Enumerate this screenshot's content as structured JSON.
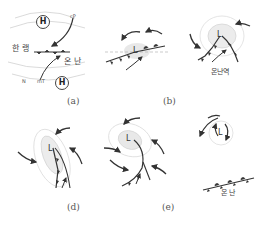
{
  "figure": {
    "colors": {
      "line": "#333333",
      "isobar": "#cfcfcf",
      "shade": "#e6e6e6"
    },
    "panels": [
      {
        "id": "a",
        "label": "(a)",
        "texts": {
          "cold": "한 랭",
          "warm": "온 난",
          "cP": "cP",
          "mT": "mT",
          "N": "N",
          "high": "H"
        },
        "description": "Stationary front between cold cP air (north) and warm mT air (south), highs on both sides"
      },
      {
        "id": "b",
        "label": "(b)",
        "texts": {
          "low": "L"
        },
        "description": "Wave forms on front; low develops with counterclockwise circulation"
      },
      {
        "id": "c",
        "label": "",
        "texts": {
          "warm_sector": "온난역",
          "low": "L"
        },
        "description": "Mature wave with warm front and cold front, warm sector between"
      },
      {
        "id": "d",
        "label": "(d)",
        "texts": {
          "low": "L"
        },
        "description": "Cold front catching warm front, beginning occlusion"
      },
      {
        "id": "e",
        "label": "(e)",
        "texts": {
          "low": "L"
        },
        "description": "Occluded front forms"
      },
      {
        "id": "f",
        "label": "",
        "texts": {
          "low": "L",
          "warm": "온 난"
        },
        "description": "Dissipating cyclone with isolated circulation; remaining warm front"
      }
    ]
  }
}
